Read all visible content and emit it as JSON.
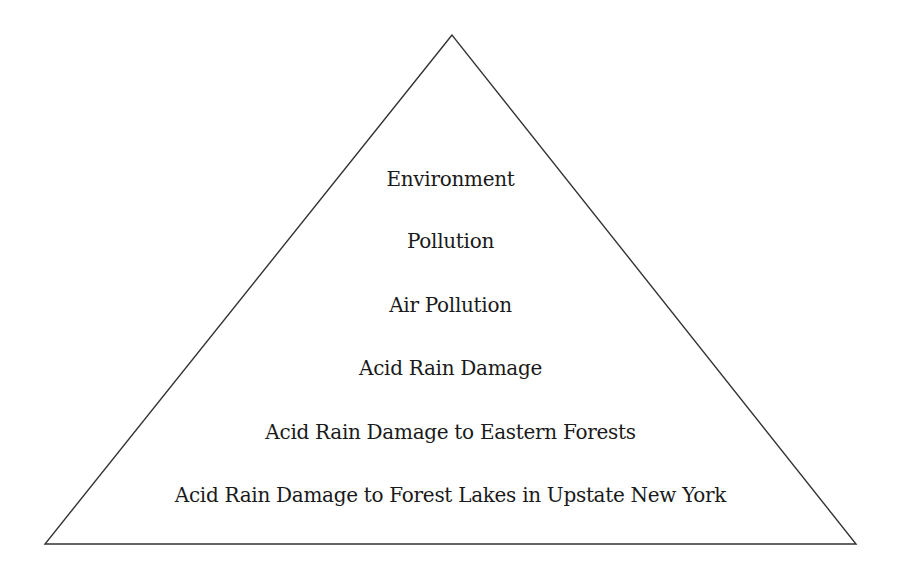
{
  "diagram": {
    "type": "hierarchy-pyramid",
    "shape": {
      "apex": [
        452,
        35
      ],
      "bottom_left": [
        45,
        544
      ],
      "bottom_right": [
        856,
        544
      ],
      "stroke_color": "#333333",
      "fill_color": "#ffffff"
    },
    "levels": [
      {
        "label": "Environment",
        "y": 167
      },
      {
        "label": "Pollution",
        "y": 229
      },
      {
        "label": "Air Pollution",
        "y": 293
      },
      {
        "label": "Acid Rain Damage",
        "y": 356
      },
      {
        "label": "Acid Rain Damage to Eastern Forests",
        "y": 420
      },
      {
        "label": "Acid Rain Damage to Forest Lakes in Upstate New York",
        "y": 483
      }
    ]
  }
}
